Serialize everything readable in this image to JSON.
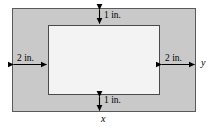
{
  "figure": {
    "outer_region": {
      "name": "shaded-margin-region",
      "fill_color": "#c9c9c9",
      "stroke_color": "#5a5a5a",
      "width_label": "x",
      "height_label": "y"
    },
    "inner_region": {
      "name": "white-printed-area",
      "fill_color": "#f3f3f3",
      "stroke_color": "#4a4a4a"
    },
    "dimensions": {
      "top_margin": "1 in.",
      "bottom_margin": "1 in.",
      "left_margin": "2 in.",
      "right_margin": "2 in."
    },
    "axis_labels": {
      "horizontal": "x",
      "vertical": "y"
    },
    "icons": {
      "top_arrow": "double-headed-vertical-arrow",
      "bottom_arrow": "double-headed-vertical-arrow",
      "left_arrow": "double-headed-horizontal-arrow",
      "right_arrow": "double-headed-horizontal-arrow"
    }
  }
}
